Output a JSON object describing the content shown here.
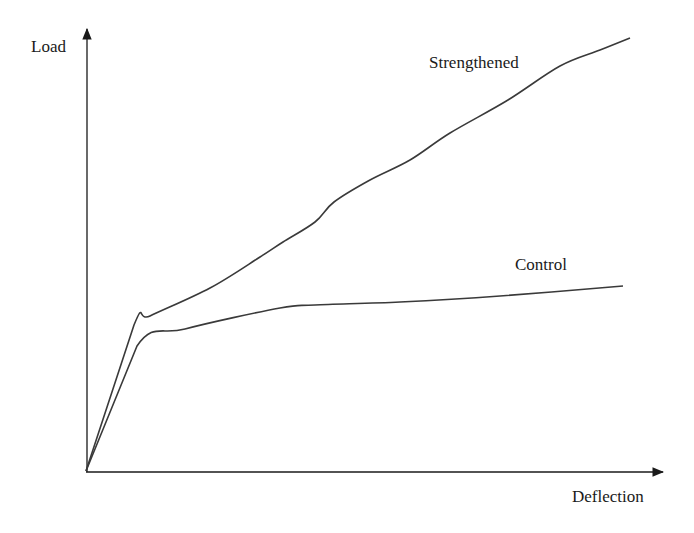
{
  "chart_data": {
    "type": "line",
    "title": "",
    "xlabel": "Deflection",
    "ylabel": "Load",
    "grid": false,
    "legend": "inline labels",
    "axes_units": "pixel-space estimates (no tick marks shown); x = deflection (px from origin), y = load (px from origin)",
    "series": [
      {
        "name": "Strengthened",
        "label_position": [
          429,
          63
        ],
        "points_px": [
          [
            86,
            471
          ],
          [
            134,
            325
          ],
          [
            150,
            316
          ],
          [
            210,
            288
          ],
          [
            260,
            257
          ],
          [
            283,
            242
          ],
          [
            315,
            222
          ],
          [
            334,
            202
          ],
          [
            370,
            180
          ],
          [
            410,
            160
          ],
          [
            450,
            133
          ],
          [
            508,
            100
          ],
          [
            560,
            66
          ],
          [
            600,
            50
          ],
          [
            630,
            38
          ]
        ],
        "x": [
          0,
          48,
          64,
          124,
          174,
          197,
          229,
          248,
          284,
          324,
          364,
          422,
          474,
          514,
          544
        ],
        "y": [
          0,
          146,
          155,
          183,
          214,
          229,
          249,
          269,
          291,
          311,
          338,
          371,
          405,
          421,
          433
        ]
      },
      {
        "name": "Control",
        "label_position": [
          515,
          265
        ],
        "points_px": [
          [
            86,
            471
          ],
          [
            137,
            346
          ],
          [
            185,
            329
          ],
          [
            280,
            308
          ],
          [
            315,
            305
          ],
          [
            400,
            302
          ],
          [
            500,
            296
          ],
          [
            623,
            286
          ]
        ],
        "x": [
          0,
          51,
          99,
          194,
          229,
          314,
          414,
          537
        ],
        "y": [
          0,
          125,
          142,
          163,
          166,
          169,
          175,
          185
        ]
      }
    ],
    "axes": {
      "origin_px": [
        86,
        471
      ],
      "x_arrow_tip_px": [
        665,
        473
      ],
      "y_arrow_tip_px": [
        87,
        27
      ]
    }
  },
  "labels": {
    "y_axis": "Load",
    "x_axis": "Deflection",
    "strengthened": "Strengthened",
    "control": "Control"
  },
  "colors": {
    "axis": "#1a1a1a",
    "curve": "#3a3a3a",
    "background": "#ffffff"
  }
}
